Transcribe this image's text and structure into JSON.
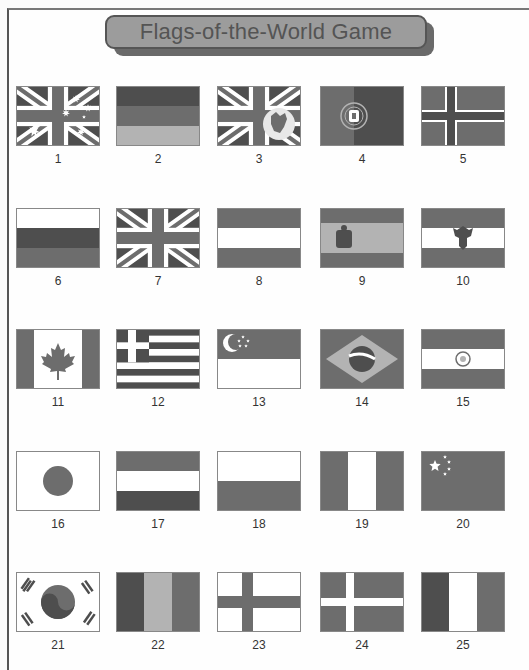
{
  "title": "Flags-of-the-World Game",
  "colors": {
    "dark": "#4e4e4e",
    "mid": "#6d6d6d",
    "light": "#b3b3b3",
    "white": "#ffffff"
  },
  "flags": [
    {
      "number": "1",
      "design": "australia"
    },
    {
      "number": "2",
      "design": "germany"
    },
    {
      "number": "3",
      "design": "hong-kong-colonial"
    },
    {
      "number": "4",
      "design": "portugal"
    },
    {
      "number": "5",
      "design": "norway"
    },
    {
      "number": "6",
      "design": "russia"
    },
    {
      "number": "7",
      "design": "united-kingdom"
    },
    {
      "number": "8",
      "design": "horizontal-red-white-red"
    },
    {
      "number": "9",
      "design": "spain"
    },
    {
      "number": "10",
      "design": "austria-eagle"
    },
    {
      "number": "11",
      "design": "canada"
    },
    {
      "number": "12",
      "design": "greece"
    },
    {
      "number": "13",
      "design": "singapore"
    },
    {
      "number": "14",
      "design": "brazil"
    },
    {
      "number": "15",
      "design": "india-like"
    },
    {
      "number": "16",
      "design": "japan"
    },
    {
      "number": "17",
      "design": "horizontal-dark-white-dark"
    },
    {
      "number": "18",
      "design": "poland"
    },
    {
      "number": "19",
      "design": "vertical-dark-white-dark"
    },
    {
      "number": "20",
      "design": "china"
    },
    {
      "number": "21",
      "design": "south-korea"
    },
    {
      "number": "22",
      "design": "vertical-dark-light-dark"
    },
    {
      "number": "23",
      "design": "finland"
    },
    {
      "number": "24",
      "design": "denmark"
    },
    {
      "number": "25",
      "design": "vertical-dark-white-dark-2"
    }
  ]
}
